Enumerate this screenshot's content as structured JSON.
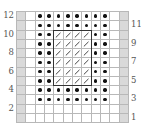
{
  "chart_data": {
    "type": "table",
    "title": "",
    "columns": 12,
    "rows": 12,
    "legend_symbols": {
      "E": "edge stitch (gray shaded)",
      "W": "blank / knit",
      "D": "dot / purl",
      "S": "diagonal slash stitch"
    },
    "row_labels_left": [
      "12",
      "10",
      "8",
      "6",
      "4",
      "2"
    ],
    "row_labels_right": [
      "11",
      "9",
      "7",
      "5",
      "3",
      "1"
    ],
    "grid_top_to_bottom": [
      {
        "row": 12,
        "cells": [
          "E",
          "W",
          "D",
          "D",
          "D",
          "D",
          "D",
          "D",
          "D",
          "D",
          "W",
          "E"
        ]
      },
      {
        "row": 11,
        "cells": [
          "E",
          "W",
          "D",
          "D",
          "D",
          "D",
          "D",
          "D",
          "D",
          "D",
          "W",
          "E"
        ]
      },
      {
        "row": 10,
        "cells": [
          "E",
          "W",
          "D",
          "D",
          "S",
          "S",
          "S",
          "S",
          "D",
          "D",
          "W",
          "E"
        ]
      },
      {
        "row": 9,
        "cells": [
          "E",
          "W",
          "D",
          "D",
          "S",
          "S",
          "S",
          "S",
          "D",
          "D",
          "W",
          "E"
        ]
      },
      {
        "row": 8,
        "cells": [
          "E",
          "W",
          "D",
          "D",
          "S",
          "S",
          "S",
          "S",
          "D",
          "D",
          "W",
          "E"
        ]
      },
      {
        "row": 7,
        "cells": [
          "E",
          "W",
          "D",
          "D",
          "S",
          "S",
          "S",
          "S",
          "D",
          "D",
          "W",
          "E"
        ]
      },
      {
        "row": 6,
        "cells": [
          "E",
          "W",
          "D",
          "D",
          "S",
          "S",
          "S",
          "S",
          "D",
          "D",
          "W",
          "E"
        ]
      },
      {
        "row": 5,
        "cells": [
          "E",
          "W",
          "D",
          "D",
          "S",
          "S",
          "S",
          "S",
          "D",
          "D",
          "W",
          "E"
        ]
      },
      {
        "row": 4,
        "cells": [
          "E",
          "W",
          "D",
          "D",
          "D",
          "D",
          "D",
          "D",
          "D",
          "D",
          "W",
          "E"
        ]
      },
      {
        "row": 3,
        "cells": [
          "E",
          "W",
          "D",
          "D",
          "D",
          "D",
          "D",
          "D",
          "D",
          "D",
          "W",
          "E"
        ]
      },
      {
        "row": 2,
        "cells": [
          "E",
          "W",
          "W",
          "W",
          "W",
          "W",
          "W",
          "W",
          "W",
          "W",
          "W",
          "E"
        ]
      },
      {
        "row": 1,
        "cells": [
          "E",
          "W",
          "W",
          "W",
          "W",
          "W",
          "W",
          "W",
          "W",
          "W",
          "W",
          "E"
        ]
      }
    ],
    "outlined_region": {
      "columns": [
        5,
        8
      ],
      "rows": [
        5,
        10
      ]
    },
    "colors": {
      "edge_fill": "#d9d9d9",
      "gridline": "#b8b8b8",
      "dot": "#111111",
      "outline": "#333333",
      "slash": "#333333"
    }
  }
}
